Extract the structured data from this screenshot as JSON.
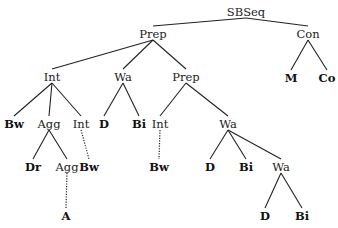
{
  "diagram": {
    "type": "syntax-tree",
    "nodes": [
      {
        "id": "n0",
        "label": "SBSeq",
        "x": 246,
        "y": 12,
        "leaf": false
      },
      {
        "id": "n1",
        "label": "Prep",
        "x": 153,
        "y": 34,
        "leaf": false
      },
      {
        "id": "n2",
        "label": "Con",
        "x": 308,
        "y": 34,
        "leaf": false
      },
      {
        "id": "n3",
        "label": "Int",
        "x": 52,
        "y": 77,
        "leaf": false
      },
      {
        "id": "n4",
        "label": "Wa",
        "x": 123,
        "y": 77,
        "leaf": false
      },
      {
        "id": "n5",
        "label": "Prep",
        "x": 186,
        "y": 77,
        "leaf": false
      },
      {
        "id": "n6",
        "label": "M",
        "x": 291,
        "y": 78,
        "leaf": true
      },
      {
        "id": "n7",
        "label": "Co",
        "x": 327,
        "y": 78,
        "leaf": true
      },
      {
        "id": "n8",
        "label": "Bw",
        "x": 14,
        "y": 124,
        "leaf": true
      },
      {
        "id": "n9",
        "label": "Agg",
        "x": 49,
        "y": 124,
        "leaf": false
      },
      {
        "id": "n10",
        "label": "Int",
        "x": 81,
        "y": 124,
        "leaf": false
      },
      {
        "id": "n11",
        "label": "D",
        "x": 104,
        "y": 124,
        "leaf": true
      },
      {
        "id": "n12",
        "label": "Bi",
        "x": 139,
        "y": 124,
        "leaf": true
      },
      {
        "id": "n13",
        "label": "Int",
        "x": 160,
        "y": 124,
        "leaf": false
      },
      {
        "id": "n14",
        "label": "Wa",
        "x": 228,
        "y": 124,
        "leaf": false
      },
      {
        "id": "n15",
        "label": "Dr",
        "x": 33,
        "y": 167,
        "leaf": true
      },
      {
        "id": "n16",
        "label": "Agg",
        "x": 67,
        "y": 167,
        "leaf": false
      },
      {
        "id": "n17",
        "label": "Bw",
        "x": 89,
        "y": 167,
        "leaf": true
      },
      {
        "id": "n18",
        "label": "Bw",
        "x": 159,
        "y": 167,
        "leaf": true
      },
      {
        "id": "n19",
        "label": "D",
        "x": 210,
        "y": 167,
        "leaf": true
      },
      {
        "id": "n20",
        "label": "Bi",
        "x": 246,
        "y": 167,
        "leaf": true
      },
      {
        "id": "n21",
        "label": "Wa",
        "x": 281,
        "y": 167,
        "leaf": false
      },
      {
        "id": "n22",
        "label": "A",
        "x": 66,
        "y": 216,
        "leaf": true
      },
      {
        "id": "n23",
        "label": "D",
        "x": 265,
        "y": 216,
        "leaf": true
      },
      {
        "id": "n24",
        "label": "Bi",
        "x": 302,
        "y": 216,
        "leaf": true
      }
    ],
    "edges": [
      {
        "from": "n0",
        "to": "n1",
        "style": "solid"
      },
      {
        "from": "n0",
        "to": "n2",
        "style": "solid"
      },
      {
        "from": "n1",
        "to": "n3",
        "style": "solid"
      },
      {
        "from": "n1",
        "to": "n4",
        "style": "solid"
      },
      {
        "from": "n1",
        "to": "n5",
        "style": "solid"
      },
      {
        "from": "n2",
        "to": "n6",
        "style": "solid"
      },
      {
        "from": "n2",
        "to": "n7",
        "style": "solid"
      },
      {
        "from": "n3",
        "to": "n8",
        "style": "solid"
      },
      {
        "from": "n3",
        "to": "n9",
        "style": "solid"
      },
      {
        "from": "n3",
        "to": "n10",
        "style": "solid"
      },
      {
        "from": "n4",
        "to": "n11",
        "style": "solid"
      },
      {
        "from": "n4",
        "to": "n12",
        "style": "solid"
      },
      {
        "from": "n5",
        "to": "n13",
        "style": "solid"
      },
      {
        "from": "n5",
        "to": "n14",
        "style": "solid"
      },
      {
        "from": "n9",
        "to": "n15",
        "style": "solid"
      },
      {
        "from": "n9",
        "to": "n16",
        "style": "solid"
      },
      {
        "from": "n10",
        "to": "n17",
        "style": "dotted"
      },
      {
        "from": "n13",
        "to": "n18",
        "style": "dotted"
      },
      {
        "from": "n14",
        "to": "n19",
        "style": "solid"
      },
      {
        "from": "n14",
        "to": "n20",
        "style": "solid"
      },
      {
        "from": "n14",
        "to": "n21",
        "style": "solid"
      },
      {
        "from": "n16",
        "to": "n22",
        "style": "dotted"
      },
      {
        "from": "n21",
        "to": "n23",
        "style": "solid"
      },
      {
        "from": "n21",
        "to": "n24",
        "style": "solid"
      }
    ]
  }
}
